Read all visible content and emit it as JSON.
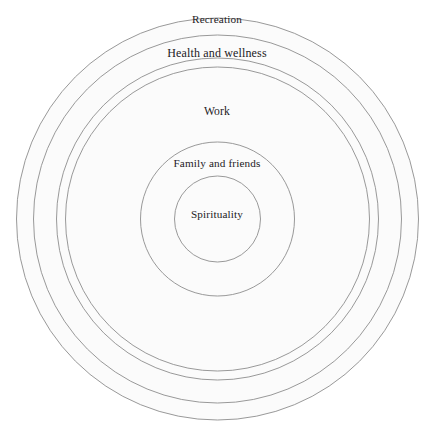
{
  "diagram": {
    "type": "concentric-circles",
    "title": "",
    "background_color": "#ffffff",
    "ring_fill_color": "#fbfbfb",
    "ring_stroke_color": "#8d8d8d",
    "text_color": "#23201d",
    "center": {
      "x": 217.5,
      "y": 219
    },
    "rings": [
      {
        "id": "outer-ring",
        "label": "",
        "radius": 201
      },
      {
        "id": "recreation",
        "label": "Recreation",
        "radius": 184
      },
      {
        "id": "health",
        "label": "Health and wellness",
        "radius": 161
      },
      {
        "id": "work",
        "label": "Work",
        "radius": 152
      },
      {
        "id": "family",
        "label": "Family and friends",
        "radius": 77
      },
      {
        "id": "spirituality",
        "label": "Spirituality",
        "radius": 43
      }
    ]
  }
}
